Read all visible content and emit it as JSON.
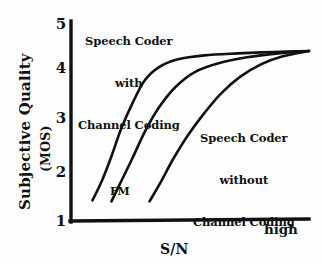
{
  "chart_data": {
    "type": "line",
    "title": "",
    "xlabel": "S/N",
    "ylabel": "Subjective Quality",
    "ylabel_unit": "(MOS)",
    "x_axis_end_label": "high",
    "ylim": [
      1,
      5
    ],
    "y_ticks": [
      "5",
      "4",
      "3",
      "2",
      "1"
    ],
    "x_ticks": [],
    "grid": false,
    "legend_position": "inline-annotations",
    "annotations": [
      {
        "name": "speech-coder-with-channel-coding",
        "lines": [
          "Speech Coder",
          "with",
          "Channel Coding"
        ],
        "refers_to": "series-1"
      },
      {
        "name": "fm",
        "lines": [
          "FM"
        ],
        "refers_to": "series-2"
      },
      {
        "name": "speech-coder-without-channel-coding",
        "lines": [
          "Speech Coder",
          "without",
          "Channel Coding"
        ],
        "refers_to": "series-3"
      }
    ],
    "series": [
      {
        "name": "Speech Coder with Channel Coding",
        "points": [
          {
            "x": 0.09,
            "y": 1.4
          },
          {
            "x": 0.13,
            "y": 1.8
          },
          {
            "x": 0.17,
            "y": 2.3
          },
          {
            "x": 0.21,
            "y": 2.85
          },
          {
            "x": 0.26,
            "y": 3.4
          },
          {
            "x": 0.31,
            "y": 3.85
          },
          {
            "x": 0.37,
            "y": 4.12
          },
          {
            "x": 0.45,
            "y": 4.28
          },
          {
            "x": 0.56,
            "y": 4.36
          },
          {
            "x": 0.7,
            "y": 4.4
          },
          {
            "x": 0.85,
            "y": 4.43
          },
          {
            "x": 1.0,
            "y": 4.45
          }
        ]
      },
      {
        "name": "FM",
        "points": [
          {
            "x": 0.17,
            "y": 1.38
          },
          {
            "x": 0.21,
            "y": 1.78
          },
          {
            "x": 0.26,
            "y": 2.28
          },
          {
            "x": 0.31,
            "y": 2.8
          },
          {
            "x": 0.37,
            "y": 3.3
          },
          {
            "x": 0.44,
            "y": 3.72
          },
          {
            "x": 0.52,
            "y": 4.02
          },
          {
            "x": 0.62,
            "y": 4.2
          },
          {
            "x": 0.74,
            "y": 4.32
          },
          {
            "x": 0.87,
            "y": 4.4
          },
          {
            "x": 1.0,
            "y": 4.45
          }
        ]
      },
      {
        "name": "Speech Coder without Channel Coding",
        "points": [
          {
            "x": 0.33,
            "y": 1.38
          },
          {
            "x": 0.38,
            "y": 1.8
          },
          {
            "x": 0.43,
            "y": 2.25
          },
          {
            "x": 0.49,
            "y": 2.72
          },
          {
            "x": 0.56,
            "y": 3.18
          },
          {
            "x": 0.63,
            "y": 3.58
          },
          {
            "x": 0.71,
            "y": 3.92
          },
          {
            "x": 0.8,
            "y": 4.18
          },
          {
            "x": 0.89,
            "y": 4.34
          },
          {
            "x": 1.0,
            "y": 4.45
          }
        ]
      }
    ]
  },
  "axis": {
    "ticks": {
      "t5": "5",
      "t4": "4",
      "t3": "3",
      "t2": "2",
      "t1": "1"
    },
    "y_title": "Subjective Quality",
    "y_unit": "(MOS)",
    "x_title": "S/N",
    "x_end": "high"
  },
  "annotations": {
    "with_coding": {
      "line1": "Speech Coder",
      "line2": "with",
      "line3": "Channel Coding"
    },
    "without_coding": {
      "line1": "Speech Coder",
      "line2": "without",
      "line3": "Channel Coding"
    },
    "fm": "FM"
  },
  "colors": {
    "ink": "#111111",
    "background": "#fdfdfd"
  }
}
